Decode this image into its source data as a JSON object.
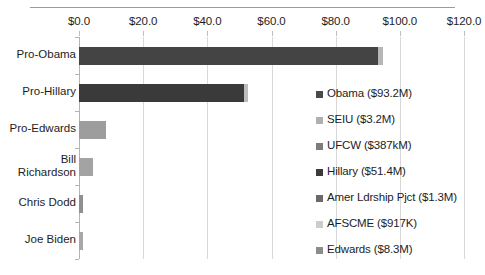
{
  "chart_data": {
    "type": "bar",
    "orientation": "horizontal",
    "stacked": true,
    "title": "",
    "xlabel": "",
    "ylabel": "",
    "xlim": [
      0,
      120
    ],
    "xticks": [
      "$0.0",
      "$20.0",
      "$40.0",
      "$60.0",
      "$80.0",
      "$100.0",
      "$120.0"
    ],
    "xtick_values": [
      0,
      20,
      40,
      60,
      80,
      100,
      120
    ],
    "grid": true,
    "legend_position": "right-inside",
    "categories": [
      "Pro-Obama",
      "Pro-Hillary",
      "Pro-Edwards",
      "Bill Richardson",
      "Chris Dodd",
      "Joe Biden"
    ],
    "series": [
      {
        "name": "Obama ($93.2M)",
        "color": "#444444",
        "values": [
          93.2,
          0,
          0,
          0,
          0,
          0
        ]
      },
      {
        "name": "SEIU ($3.2M)",
        "color": "#a6a6a6",
        "values": [
          0,
          3.2,
          0,
          0,
          0,
          0
        ]
      },
      {
        "name": "UFCW ($387kM)",
        "color": "#808080",
        "values": [
          0.387,
          0,
          0,
          0,
          0,
          0
        ]
      },
      {
        "name": "Hillary ($51.4M)",
        "color": "#3a3a3a",
        "values": [
          0,
          51.4,
          0,
          0,
          0,
          0
        ]
      },
      {
        "name": "Amer Ldrship Pjct ($1.3M)",
        "color": "#6e6e6e",
        "values": [
          0,
          0,
          1.3,
          0,
          0,
          0
        ]
      },
      {
        "name": "AFSCME ($917K)",
        "color": "#c9c9c9",
        "values": [
          0,
          0,
          0.917,
          0,
          0,
          0
        ]
      },
      {
        "name": "Edwards ($8.3M)",
        "color": "#949494",
        "values": [
          0,
          0,
          8.3,
          0,
          0,
          0
        ]
      }
    ],
    "bars": [
      {
        "category": "Pro-Obama",
        "segments": [
          {
            "label": "Obama ($93.2M)",
            "value": 93.2,
            "color": "#444444"
          },
          {
            "label": "UFCW ($387kM)",
            "value": 1.6,
            "color": "#b7b7b7"
          }
        ]
      },
      {
        "category": "Pro-Hillary",
        "segments": [
          {
            "label": "Hillary ($51.4M)",
            "value": 51.4,
            "color": "#3a3a3a"
          },
          {
            "label": "SEIU ($3.2M)",
            "value": 1.3,
            "color": "#bdbdbd"
          }
        ]
      },
      {
        "category": "Pro-Edwards",
        "segments": [
          {
            "label": "Edwards ($8.3M)",
            "value": 8.3,
            "color": "#9d9d9d"
          }
        ]
      },
      {
        "category": "Bill Richardson",
        "segments": [
          {
            "label": "Bill Richardson",
            "value": 4.3,
            "color": "#a3a3a3"
          }
        ]
      },
      {
        "category": "Chris Dodd",
        "segments": [
          {
            "label": "Chris Dodd",
            "value": 1.3,
            "color": "#8f8f8f"
          }
        ]
      },
      {
        "category": "Joe Biden",
        "segments": [
          {
            "label": "Joe Biden",
            "value": 1.4,
            "color": "#a8a8a8"
          }
        ]
      }
    ]
  },
  "axis": {
    "ticks": [
      {
        "label": "$0.0",
        "value": 0
      },
      {
        "label": "$20.0",
        "value": 20
      },
      {
        "label": "$40.0",
        "value": 40
      },
      {
        "label": "$60.0",
        "value": 60
      },
      {
        "label": "$80.0",
        "value": 80
      },
      {
        "label": "$100.0",
        "value": 100
      },
      {
        "label": "$120.0",
        "value": 120
      }
    ]
  },
  "categories": [
    {
      "label": "Pro-Obama"
    },
    {
      "label": "Pro-Hillary"
    },
    {
      "label": "Pro-Edwards"
    },
    {
      "label": "Bill\nRichardson"
    },
    {
      "label": "Chris Dodd"
    },
    {
      "label": "Joe Biden"
    }
  ],
  "legend": {
    "items": [
      {
        "label": "Obama ($93.2M)",
        "color": "#4a4a4a"
      },
      {
        "label": "SEIU ($3.2M)",
        "color": "#b0b0b0"
      },
      {
        "label": "UFCW ($387kM)",
        "color": "#7d7d7d"
      },
      {
        "label": "Hillary ($51.4M)",
        "color": "#3b3b3b"
      },
      {
        "label": "Amer Ldrship Pjct ($1.3M)",
        "color": "#6a6a6a"
      },
      {
        "label": "AFSCME ($917K)",
        "color": "#cccccc"
      },
      {
        "label": "Edwards ($8.3M)",
        "color": "#8c8c8c"
      }
    ]
  }
}
